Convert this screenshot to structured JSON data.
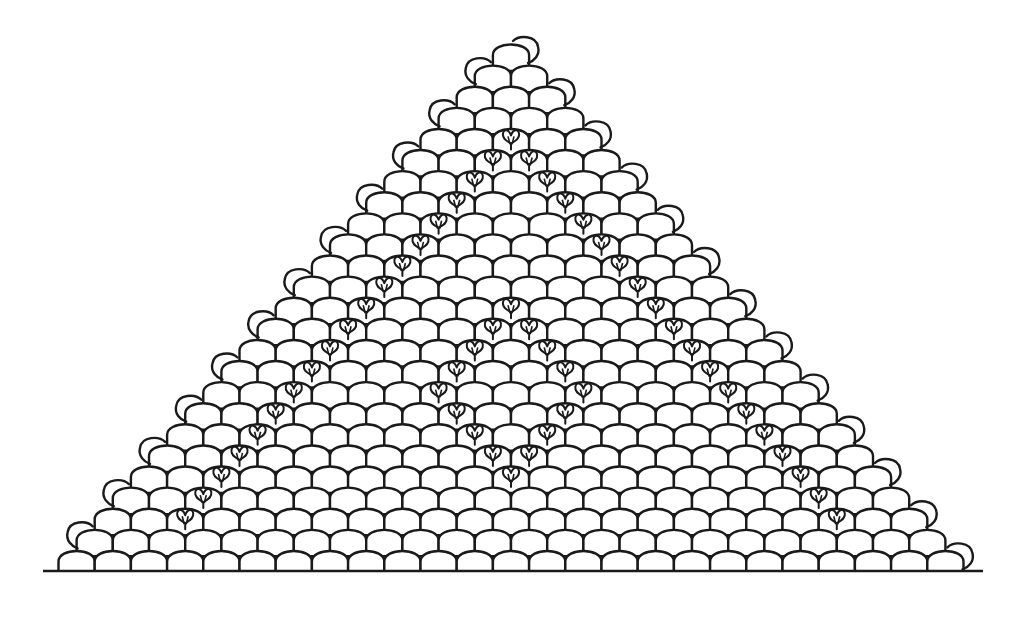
{
  "figure": {
    "ink_color": "#1a1a1a",
    "background_color": "#ffffff",
    "baseline": {
      "x1": 43,
      "x2": 983,
      "y": 571
    },
    "lattice": {
      "rows": 25,
      "apex_center_x": 511,
      "apex_arc_top_y": 43,
      "cell_width": 36.2,
      "row_pitch": 21.1,
      "cell_height": 22
    },
    "caps": {
      "description": "small overhanging arc on alternating row ends: even rows on the right, odd rows on the left",
      "even_rows_side": "right",
      "odd_rows_side": "left"
    },
    "hearts": {
      "outer_left_diagonal": {
        "from_row": 4,
        "to_row": 22,
        "col": 2
      },
      "outer_right_diagonal": {
        "from_row": 4,
        "to_row": 22,
        "col_offset_from_row": -2
      },
      "inner_diamond": [
        [
          12,
          6
        ],
        [
          13,
          6
        ],
        [
          13,
          7
        ],
        [
          14,
          6
        ],
        [
          14,
          8
        ],
        [
          15,
          6
        ],
        [
          15,
          9
        ],
        [
          16,
          6
        ],
        [
          16,
          10
        ],
        [
          17,
          7
        ],
        [
          17,
          10
        ],
        [
          18,
          8
        ],
        [
          18,
          10
        ],
        [
          19,
          9
        ],
        [
          19,
          10
        ],
        [
          20,
          10
        ]
      ]
    }
  }
}
